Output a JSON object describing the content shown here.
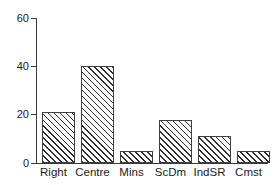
{
  "chart_data": {
    "type": "bar",
    "title": "",
    "subtitle": "",
    "xlabel": "",
    "ylabel": "",
    "categories": [
      "Right",
      "Centre",
      "Mins",
      "ScDm",
      "IndSR",
      "Cmst"
    ],
    "values": [
      21,
      40,
      5,
      18,
      11,
      5
    ],
    "series": [
      {
        "name": "",
        "values": [
          21,
          40,
          5,
          18,
          11,
          5
        ]
      }
    ],
    "ylim": [
      0,
      60
    ],
    "yticks": [
      0,
      20,
      40,
      60
    ],
    "ytick_labels": [
      "0",
      "20",
      "40",
      "60"
    ],
    "grid": false,
    "legend": false,
    "legend_position": "none",
    "bar_fill": "hatched-diagonal",
    "bar_edge_color": "#3f3f3f",
    "background_color": "#ffffff",
    "text_color": "#1a1a1a",
    "annotations": []
  }
}
